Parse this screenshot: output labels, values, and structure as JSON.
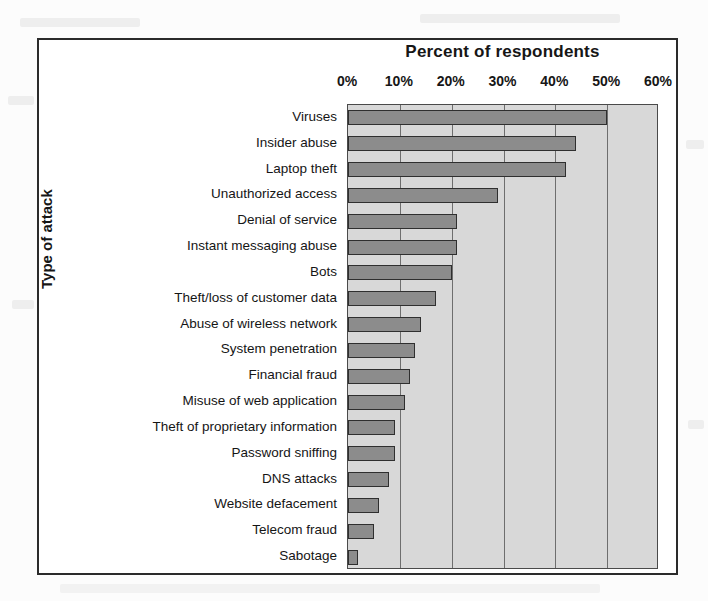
{
  "figure": {
    "title": "Percent of respondents",
    "y_axis_title": "Type of attack"
  },
  "chart_data": {
    "type": "bar",
    "orientation": "horizontal",
    "title": "Percent of respondents",
    "xlabel": "Percent of respondents",
    "ylabel": "Type of attack",
    "xlim": [
      0,
      60
    ],
    "xticks": [
      0,
      10,
      20,
      30,
      40,
      50,
      60
    ],
    "xtick_labels": [
      "0%",
      "10%",
      "20%",
      "30%",
      "40%",
      "50%",
      "60%"
    ],
    "grid": true,
    "legend": null,
    "categories": [
      "Viruses",
      "Insider abuse",
      "Laptop theft",
      "Unauthorized access",
      "Denial of service",
      "Instant messaging abuse",
      "Bots",
      "Theft/loss of customer data",
      "Abuse of wireless network",
      "System penetration",
      "Financial fraud",
      "Misuse of web application",
      "Theft of proprietary information",
      "Password sniffing",
      "DNS attacks",
      "Website defacement",
      "Telecom fraud",
      "Sabotage"
    ],
    "values": [
      50,
      44,
      42,
      29,
      21,
      21,
      20,
      17,
      14,
      13,
      12,
      11,
      9,
      9,
      8,
      6,
      5,
      2
    ],
    "bar_color": "#8c8c8c",
    "bar_edge_color": "#2f2f2f",
    "plot_background": "#d8d8d8"
  }
}
